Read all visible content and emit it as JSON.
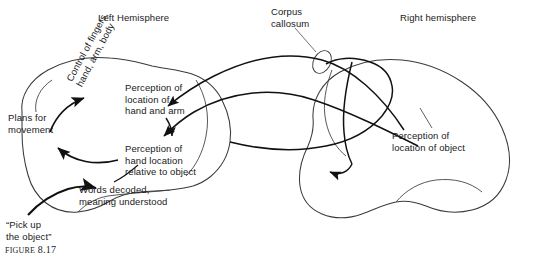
{
  "figure": {
    "caption_label": "Figure",
    "caption_number": "8.17",
    "titles": {
      "left_hemisphere": "Left Hemisphere",
      "right_hemisphere": "Right hemisphere",
      "corpus_callosum": "Corpus\ncallosum"
    },
    "left_hemisphere_regions": [
      {
        "id": "plans-for-movement",
        "text": "Plans for\nmovement"
      },
      {
        "id": "control-of-fingers",
        "text": "Control of fingers,\nhand, arm, body"
      },
      {
        "id": "perception-hand-arm",
        "text": "Perception of\nlocation of\nhand and arm"
      },
      {
        "id": "perception-hand-rel",
        "text": "Perception of\nhand location\nrelative to object"
      },
      {
        "id": "words-decoded",
        "text": "Words decoded,\nmeaning understood"
      }
    ],
    "right_hemisphere_regions": [
      {
        "id": "perception-object",
        "text": "Perception of\nlocation of object"
      }
    ],
    "spoken_instruction": "“Pick up\nthe object”",
    "colors": {
      "ink": "#1a1a1a",
      "outline": "#3a3a3a",
      "arrow": "#111111",
      "background": "#ffffff"
    }
  }
}
